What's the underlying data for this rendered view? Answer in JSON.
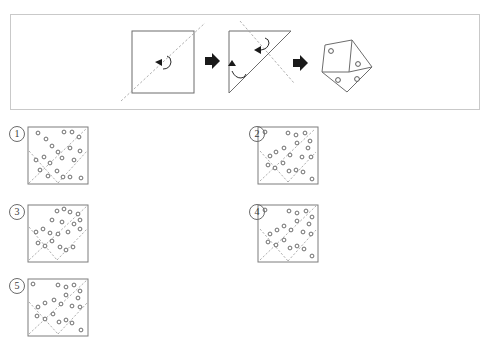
{
  "page": {
    "width": 491,
    "height": 339,
    "background": "#ffffff",
    "type": "paper-folding-hole-punch-puzzle"
  },
  "colors": {
    "frame_border": "#c9c9c9",
    "shape_stroke": "#6d6d6d",
    "square_stroke": "#7d7d7d",
    "fold_dash": "#9b9b9b",
    "hole_stroke": "#5e5e5e",
    "arrow_fill": "#1a1a1a",
    "label_text": "#3a3a3a",
    "paper_fill": "#ffffff"
  },
  "prompt_panel": {
    "name": "folding-sequence-panel",
    "frame": {
      "x": 10,
      "y": 14,
      "w": 470,
      "h": 96
    },
    "steps": [
      {
        "index": 1,
        "label": "step-1-square-with-diagonal-fold-line",
        "shape": "square",
        "x": 132,
        "y": 31,
        "w": 62,
        "h": 62,
        "fold_line": {
          "from": [
            122,
            100
          ],
          "to": [
            204,
            24
          ],
          "style": "dashed"
        },
        "fold_arrow": "fold-bottom-right-over-to-top-left"
      },
      {
        "index": 2,
        "label": "step-2-triangle-with-second-fold-line",
        "shape": "triangle",
        "points": [
          [
            229,
            31
          ],
          [
            291,
            31
          ],
          [
            229,
            93
          ]
        ],
        "fold_line": {
          "from": [
            239,
            22
          ],
          "to": [
            291,
            82
          ],
          "style": "dashed"
        },
        "fold_arrows": 2
      },
      {
        "index": 3,
        "label": "step-3-folded-polygon-with-punched-holes",
        "shape": "folded-polygon",
        "holes": 4,
        "hole_positions": [
          [
            330,
            51
          ],
          [
            359,
            64
          ],
          [
            339,
            80
          ],
          [
            358,
            79
          ]
        ]
      }
    ],
    "arrows": [
      {
        "name": "arrow-step1-to-step2",
        "x": 207,
        "y": 60
      },
      {
        "name": "arrow-step2-to-step3",
        "x": 295,
        "y": 62
      }
    ]
  },
  "options": [
    {
      "id": 1,
      "label": "1",
      "name": "option-1",
      "label_pos": {
        "x": 9,
        "y": 126
      },
      "square": {
        "x": 28,
        "y": 127,
        "w": 60,
        "h": 57
      },
      "fold_lines": [
        {
          "from": [
            30,
            182
          ],
          "to": [
            86,
            129
          ]
        },
        {
          "from": [
            30,
            152
          ],
          "to": [
            58,
            182
          ]
        },
        {
          "from": [
            58,
            182
          ],
          "to": [
            86,
            152
          ]
        }
      ],
      "holes": [
        [
          38,
          133
        ],
        [
          52,
          146
        ],
        [
          64,
          132
        ],
        [
          72,
          132
        ],
        [
          79,
          137
        ],
        [
          46,
          139
        ],
        [
          58,
          152
        ],
        [
          70,
          148
        ],
        [
          80,
          151
        ],
        [
          36,
          160
        ],
        [
          44,
          157
        ],
        [
          50,
          163
        ],
        [
          62,
          158
        ],
        [
          74,
          160
        ],
        [
          40,
          170
        ],
        [
          48,
          176
        ],
        [
          57,
          171
        ],
        [
          63,
          177
        ],
        [
          70,
          177
        ],
        [
          81,
          178
        ]
      ]
    },
    {
      "id": 2,
      "label": "2",
      "name": "option-2",
      "label_pos": {
        "x": 249,
        "y": 126
      },
      "square": {
        "x": 258,
        "y": 127,
        "w": 60,
        "h": 57
      },
      "fold_lines": [
        {
          "from": [
            262,
            180
          ],
          "to": [
            314,
            130
          ]
        },
        {
          "from": [
            262,
            152
          ],
          "to": [
            288,
            181
          ]
        },
        {
          "from": [
            288,
            181
          ],
          "to": [
            314,
            153
          ]
        }
      ],
      "holes": [
        [
          265,
          132
        ],
        [
          288,
          133
        ],
        [
          296,
          135
        ],
        [
          305,
          133
        ],
        [
          310,
          141
        ],
        [
          297,
          143
        ],
        [
          308,
          148
        ],
        [
          284,
          148
        ],
        [
          290,
          155
        ],
        [
          270,
          156
        ],
        [
          276,
          152
        ],
        [
          302,
          157
        ],
        [
          311,
          157
        ],
        [
          268,
          165
        ],
        [
          275,
          168
        ],
        [
          283,
          163
        ],
        [
          289,
          171
        ],
        [
          296,
          170
        ],
        [
          303,
          172
        ],
        [
          312,
          179
        ]
      ]
    },
    {
      "id": 3,
      "label": "3",
      "name": "option-3",
      "label_pos": {
        "x": 9,
        "y": 204
      },
      "square": {
        "x": 28,
        "y": 205,
        "w": 60,
        "h": 57
      },
      "fold_lines": [
        {
          "from": [
            30,
            259
          ],
          "to": [
            86,
            207
          ]
        },
        {
          "from": [
            30,
            228
          ],
          "to": [
            57,
            259
          ]
        },
        {
          "from": [
            57,
            259
          ],
          "to": [
            86,
            230
          ]
        }
      ],
      "holes": [
        [
          57,
          211
        ],
        [
          64,
          209
        ],
        [
          70,
          212
        ],
        [
          78,
          214
        ],
        [
          80,
          220
        ],
        [
          52,
          220
        ],
        [
          62,
          222
        ],
        [
          74,
          224
        ],
        [
          80,
          229
        ],
        [
          36,
          232
        ],
        [
          43,
          229
        ],
        [
          50,
          233
        ],
        [
          58,
          234
        ],
        [
          68,
          232
        ],
        [
          38,
          243
        ],
        [
          45,
          246
        ],
        [
          52,
          241
        ],
        [
          60,
          247
        ],
        [
          66,
          250
        ],
        [
          73,
          247
        ]
      ]
    },
    {
      "id": 4,
      "label": "4",
      "name": "option-4",
      "label_pos": {
        "x": 249,
        "y": 204
      },
      "square": {
        "x": 258,
        "y": 205,
        "w": 60,
        "h": 57
      },
      "fold_lines": [
        {
          "from": [
            261,
            259
          ],
          "to": [
            315,
            207
          ]
        },
        {
          "from": [
            261,
            230
          ],
          "to": [
            288,
            259
          ]
        },
        {
          "from": [
            288,
            259
          ],
          "to": [
            315,
            231
          ]
        }
      ],
      "holes": [
        [
          265,
          210
        ],
        [
          289,
          211
        ],
        [
          297,
          213
        ],
        [
          306,
          211
        ],
        [
          312,
          217
        ],
        [
          297,
          221
        ],
        [
          309,
          224
        ],
        [
          284,
          226
        ],
        [
          291,
          230
        ],
        [
          270,
          234
        ],
        [
          277,
          230
        ],
        [
          303,
          232
        ],
        [
          311,
          234
        ],
        [
          268,
          242
        ],
        [
          276,
          245
        ],
        [
          284,
          240
        ],
        [
          290,
          248
        ],
        [
          297,
          246
        ],
        [
          304,
          249
        ],
        [
          312,
          256
        ]
      ]
    },
    {
      "id": 5,
      "label": "5",
      "name": "option-5",
      "label_pos": {
        "x": 9,
        "y": 278
      },
      "square": {
        "x": 28,
        "y": 279,
        "w": 60,
        "h": 57
      },
      "fold_lines": [
        {
          "from": [
            30,
            333
          ],
          "to": [
            86,
            281
          ]
        },
        {
          "from": [
            30,
            303
          ],
          "to": [
            58,
            333
          ]
        },
        {
          "from": [
            58,
            333
          ],
          "to": [
            86,
            304
          ]
        }
      ],
      "holes": [
        [
          33,
          284
        ],
        [
          58,
          285
        ],
        [
          66,
          287
        ],
        [
          74,
          285
        ],
        [
          80,
          291
        ],
        [
          66,
          295
        ],
        [
          78,
          298
        ],
        [
          54,
          300
        ],
        [
          61,
          304
        ],
        [
          38,
          307
        ],
        [
          45,
          303
        ],
        [
          72,
          306
        ],
        [
          80,
          307
        ],
        [
          37,
          316
        ],
        [
          45,
          319
        ],
        [
          53,
          314
        ],
        [
          59,
          322
        ],
        [
          66,
          320
        ],
        [
          72,
          323
        ],
        [
          81,
          330
        ]
      ]
    }
  ]
}
